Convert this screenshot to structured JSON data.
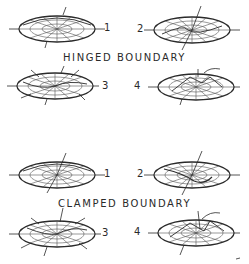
{
  "sections": [
    {
      "title": "HINGED BOUNDARY",
      "modes": [
        {
          "label": "1",
          "side": "right"
        },
        {
          "label": "2",
          "side": "left"
        },
        {
          "label": "3",
          "side": "right"
        },
        {
          "label": "4",
          "side": "left"
        }
      ]
    },
    {
      "title": "CLAMPED BOUNDARY",
      "modes": [
        {
          "label": "1",
          "side": "right"
        },
        {
          "label": "2",
          "side": "left"
        },
        {
          "label": "3",
          "side": "right"
        },
        {
          "label": "4",
          "side": "left"
        }
      ]
    }
  ],
  "colors": {
    "ink": "#2a2a2a",
    "background": "#ffffff"
  }
}
